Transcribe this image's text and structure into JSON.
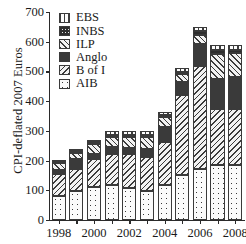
{
  "chart_data": {
    "type": "bar",
    "stacked": true,
    "title": "",
    "xlabel": "",
    "ylabel": "CPI-deflated 2007 Euros",
    "ylim": [
      0,
      700
    ],
    "ytick_values": [
      0,
      100,
      200,
      300,
      400,
      500,
      600,
      700
    ],
    "ytick_labels": [
      "0",
      "100",
      "200",
      "300",
      "400",
      "500",
      "600",
      "700"
    ],
    "grid": false,
    "legend_position": "top-left",
    "categories": [
      1998,
      1999,
      2000,
      2001,
      2002,
      2003,
      2004,
      2005,
      2006,
      2007,
      2008
    ],
    "xtick_labels": [
      "1998",
      "",
      "2000",
      "",
      "2002",
      "",
      "2004",
      "",
      "2006",
      "",
      "2008"
    ],
    "series": [
      {
        "name": "AIB",
        "pattern": "sparse-dots",
        "values": [
          80,
          96,
          110,
          117,
          108,
          96,
          119,
          151,
          171,
          184,
          184
        ]
      },
      {
        "name": "B of I",
        "pattern": "diagonal-hatch-left",
        "values": [
          75,
          76,
          95,
          106,
          114,
          116,
          144,
          271,
          347,
          191,
          191
        ]
      },
      {
        "name": "Anglo",
        "pattern": "solid-dark",
        "values": [
          13,
          32,
          18,
          23,
          22,
          28,
          51,
          44,
          74,
          101,
          106
        ]
      },
      {
        "name": "ILP",
        "pattern": "diagonal-hatch-right",
        "values": [
          25,
          23,
          34,
          34,
          35,
          38,
          33,
          27,
          32,
          84,
          80
        ]
      },
      {
        "name": "INBS",
        "pattern": "checker",
        "values": [
          3,
          4,
          5,
          6,
          7,
          8,
          5,
          5,
          12,
          12,
          11
        ]
      },
      {
        "name": "EBS",
        "pattern": "vertical-lines",
        "values": [
          4,
          5,
          7,
          12,
          12,
          12,
          10,
          12,
          12,
          17,
          17
        ]
      }
    ],
    "legend": [
      {
        "label": "EBS",
        "pattern": "vertical-lines"
      },
      {
        "label": "INBS",
        "pattern": "checker"
      },
      {
        "label": "ILP",
        "pattern": "diagonal-hatch-right"
      },
      {
        "label": "Anglo",
        "pattern": "solid-dark"
      },
      {
        "label": "B of I",
        "pattern": "diagonal-hatch-left"
      },
      {
        "label": "AIB",
        "pattern": "sparse-dots"
      }
    ]
  }
}
